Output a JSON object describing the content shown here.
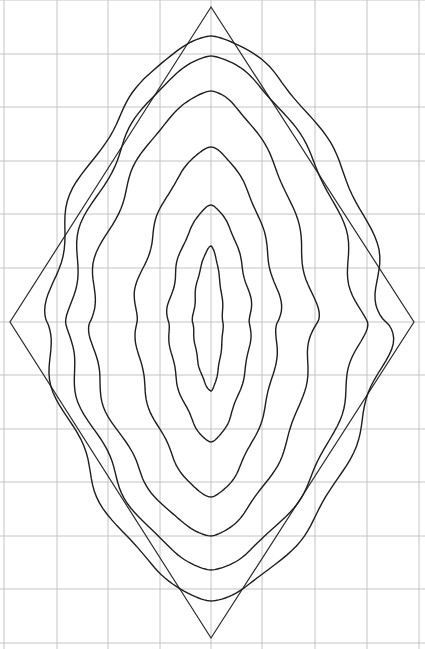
{
  "figure": {
    "width": 425,
    "height": 649,
    "colors": {
      "background": "#ffffff",
      "grid": "#c4c4c4",
      "outline": "#2a2a2a",
      "contour": "#1e1e1e"
    }
  },
  "grid": {
    "vertical_x": [
      4,
      57,
      108,
      160,
      211,
      262,
      315,
      367,
      419
    ],
    "horizontal_y": [
      0,
      54,
      107,
      161,
      214,
      268,
      322,
      375,
      429,
      482,
      536,
      589,
      643
    ]
  },
  "diamond": {
    "top": [
      211,
      7
    ],
    "right": [
      414,
      322
    ],
    "bottom": [
      211,
      638
    ],
    "left": [
      10,
      322
    ]
  },
  "contours": [
    {
      "name": "loop-1",
      "top": 36,
      "bottom": 601,
      "left": 47,
      "right": 386
    },
    {
      "name": "loop-2",
      "top": 56,
      "bottom": 570,
      "left": 68,
      "right": 360
    },
    {
      "name": "loop-3",
      "top": 91,
      "bottom": 536,
      "left": 90,
      "right": 314
    },
    {
      "name": "loop-4",
      "top": 147,
      "bottom": 497,
      "left": 135,
      "right": 279
    },
    {
      "name": "loop-5",
      "top": 205,
      "bottom": 442,
      "left": 168,
      "right": 251
    },
    {
      "name": "loop-6",
      "top": 246,
      "bottom": 391,
      "left": 193,
      "right": 223
    }
  ]
}
